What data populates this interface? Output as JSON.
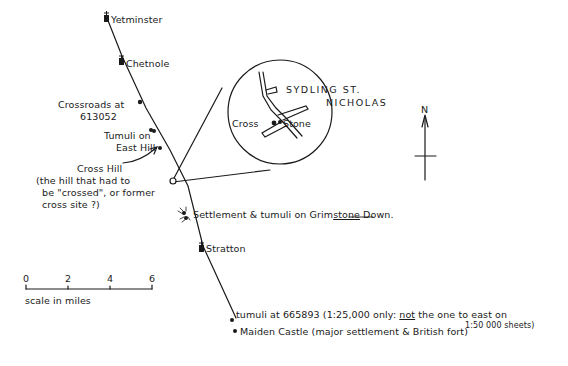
{
  "route": {
    "places": [
      {
        "name": "Yetminster",
        "symbol": "church"
      },
      {
        "name": "Chetnole",
        "symbol": "church"
      },
      {
        "name": "Crossroads at 613052",
        "symbol": "dot"
      },
      {
        "name": "Tumuli on East Hill",
        "symbol": "double-dot"
      },
      {
        "name": "Cross Hill",
        "symbol": "open-circle"
      },
      {
        "name": "Settlement & tumuli on Grimstone Down.",
        "symbol": "settlement"
      },
      {
        "name": "Stratton",
        "symbol": "church"
      },
      {
        "name": "tumuli at 665893",
        "symbol": "dot"
      },
      {
        "name": "Maiden Castle",
        "symbol": "dot"
      }
    ]
  },
  "labels": {
    "yetminster": "Yetminster",
    "chetnole": "Chetnole",
    "crossroads_line1": "Crossroads at",
    "crossroads_line2": "613052",
    "tumuli_line1": "Tumuli on",
    "tumuli_line2": "East Hill",
    "cross_hill_title": "Cross Hill",
    "cross_hill_note_line1": "(the hill that had to",
    "cross_hill_note_line2": "be \"crossed\", or former",
    "cross_hill_note_line3": "cross site ?)",
    "settlement_prefix": "Settlement & tumuli on ",
    "settlement_underlined": "Grimstone",
    "settlement_pre_underline": "Grim",
    "settlement_suffix": " Down.",
    "stratton": "Stratton",
    "tumuli_665893_main": "tumuli  at 665893 (1:25,000 only: ",
    "tumuli_665893_not": "not",
    "tumuli_665893_rest": " the one to east on",
    "tumuli_665893_line2": "1:50 000 sheets)",
    "maiden_castle": "Maiden Castle (major settlement & British fort)"
  },
  "inset": {
    "title_line1": "SYDLING ST.",
    "title_line2": "NICHOLAS",
    "cross_label": "Cross",
    "stone_label": "Stone"
  },
  "north_arrow": {
    "label": "N"
  },
  "scale_bar": {
    "ticks": [
      "0",
      "2",
      "4",
      "6"
    ],
    "caption": "scale in miles"
  },
  "colors": {
    "ink": "#1a1a1a",
    "background": "#ffffff"
  }
}
